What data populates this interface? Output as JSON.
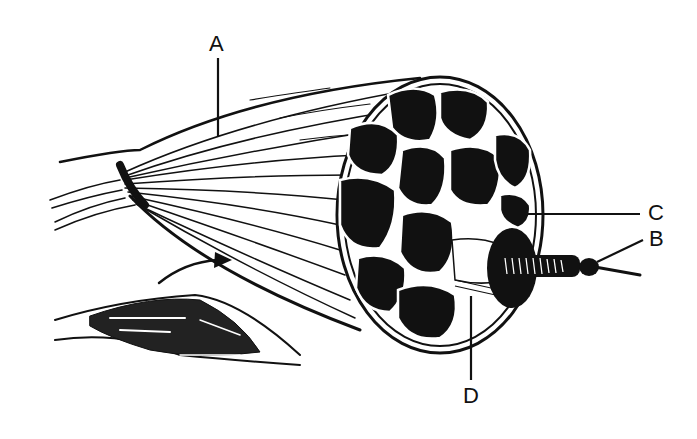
{
  "figure": {
    "background": "#ffffff",
    "ink_color": "#111111",
    "labels": [
      {
        "id": "A",
        "text": "A",
        "x": 210,
        "y": 32
      },
      {
        "id": "B",
        "text": "B",
        "x": 649,
        "y": 232
      },
      {
        "id": "C",
        "text": "C",
        "x": 648,
        "y": 201
      },
      {
        "id": "D",
        "text": "D",
        "x": 464,
        "y": 385
      }
    ],
    "leader_lines": [
      {
        "for": "A",
        "x1": 218,
        "y1": 58,
        "x2": 218,
        "y2": 136
      },
      {
        "for": "B",
        "x1": 643,
        "y1": 240,
        "x2": 597,
        "y2": 262
      },
      {
        "for": "C",
        "x1": 640,
        "y1": 214,
        "x2": 520,
        "y2": 214
      },
      {
        "for": "D",
        "x1": 471,
        "y1": 380,
        "x2": 471,
        "y2": 296
      }
    ],
    "inset": {
      "description": "small whole-muscle sketch with arrow pointing to enlarged view"
    }
  }
}
